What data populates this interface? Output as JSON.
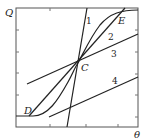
{
  "axes": {
    "y_label": "Q",
    "x_label": "θ"
  },
  "points": {
    "C": "C",
    "D": "D",
    "E": "E"
  },
  "lines": [
    {
      "id": "1",
      "label": "1",
      "kind": "steep line through C"
    },
    {
      "id": "2",
      "label": "2",
      "kind": "line D–C–E"
    },
    {
      "id": "3",
      "label": "3",
      "kind": "shallow line through C"
    },
    {
      "id": "4",
      "label": "4",
      "kind": "shallow line, lower right"
    }
  ],
  "curve": {
    "kind": "S-shaped sigmoid curve through D, C, E"
  },
  "colors": {
    "stroke": "#222222",
    "frame": "#555555"
  }
}
